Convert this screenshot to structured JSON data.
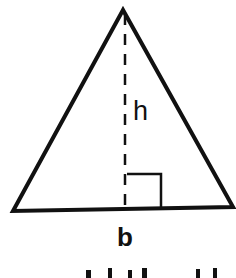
{
  "diagram": {
    "shape": "triangle",
    "stroke_color": "#111111",
    "background": "#ffffff",
    "vertices": {
      "apex": [
        123,
        10
      ],
      "base_left": [
        13,
        211
      ],
      "base_right": [
        233,
        208
      ]
    },
    "altitude": {
      "x": 125,
      "y_top": 12,
      "y_bottom": 209,
      "style": "dashed"
    },
    "right_angle_marker": {
      "x1": 128,
      "x2": 161,
      "y_top": 174
    },
    "labels": {
      "height": "h",
      "base": "b"
    },
    "caption_partial": "area of a triangle (cut off)"
  }
}
